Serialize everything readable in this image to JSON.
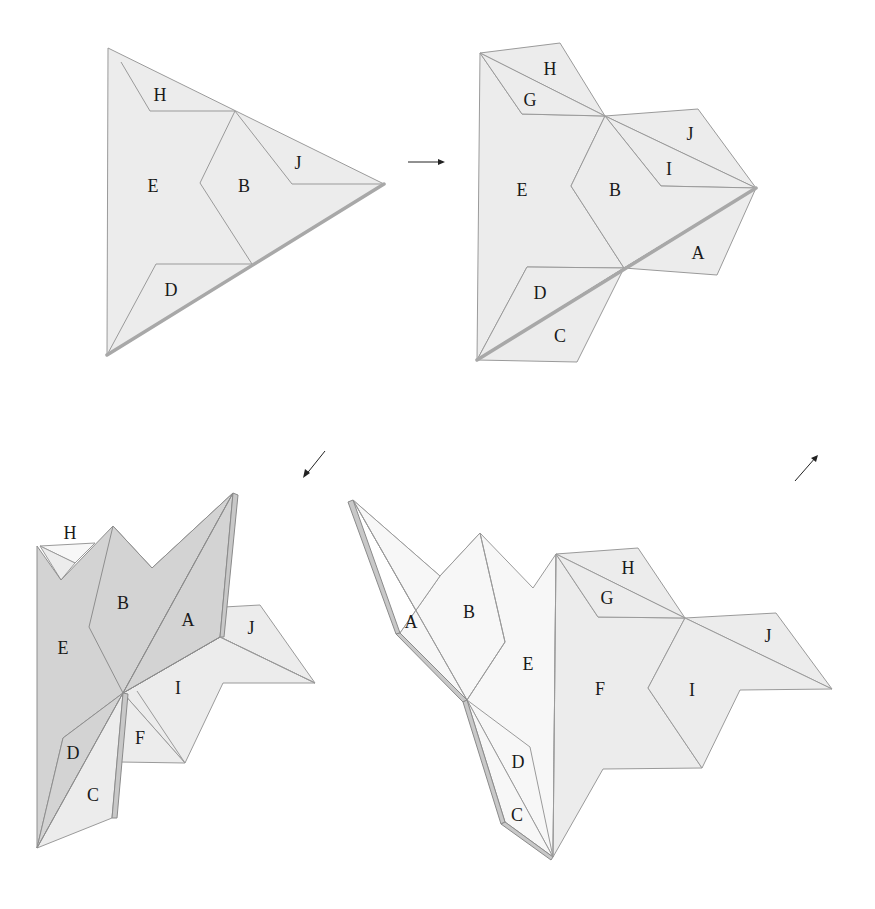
{
  "figures": [
    {
      "id": "step-1",
      "description": "Folded triangle with regions labeled",
      "labels": [
        "H",
        "E",
        "B",
        "J",
        "D"
      ]
    },
    {
      "id": "step-2",
      "description": "Partially unfolded net with all flaps",
      "labels": [
        "H",
        "G",
        "J",
        "I",
        "E",
        "B",
        "A",
        "D",
        "C"
      ]
    },
    {
      "id": "step-3",
      "description": "3D folded state, shaded side up",
      "labels": [
        "H",
        "B",
        "A",
        "E",
        "J",
        "I",
        "D",
        "F",
        "C"
      ]
    },
    {
      "id": "step-4",
      "description": "Alternative unfolded arrangement",
      "labels": [
        "H",
        "G",
        "A",
        "B",
        "J",
        "E",
        "F",
        "I",
        "D",
        "C"
      ]
    }
  ],
  "arrows": [
    {
      "from": "step-1",
      "to": "step-2",
      "direction": "right",
      "glyph": "→"
    },
    {
      "from": "step-2",
      "to": "step-3",
      "direction": "down-left",
      "glyph": "↙"
    },
    {
      "from": "step-3",
      "to": "step-4",
      "direction": "up-right",
      "glyph": "↗"
    }
  ],
  "colors": {
    "face_light": "#ececec",
    "face_dark": "#d3d3d3",
    "outline": "#9a9a9a",
    "text": "#1a1a1a"
  }
}
